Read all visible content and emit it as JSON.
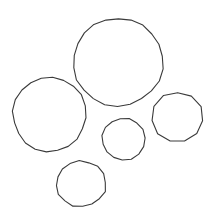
{
  "image": {
    "title": "circle-count-image",
    "width": 207,
    "height": 216,
    "background_color": "#ffffff",
    "stroke_color": "#3a3a3a",
    "stroke_width": 1.1,
    "fill": "none",
    "shape_type": "circle",
    "shape_count": 5,
    "render_style": "hand-drawn-polygonal-outline"
  },
  "shapes": [
    {
      "name": "circle-large-top-center",
      "label": "Large circle",
      "cx": 118,
      "cy": 62,
      "rx": 45,
      "ry": 44,
      "diameter": 90,
      "sides": 22,
      "jitter": 0.9,
      "seed": 11,
      "size_rank": 1
    },
    {
      "name": "circle-left",
      "label": "Left circle",
      "cx": 49.5,
      "cy": 114.5,
      "rx": 36.5,
      "ry": 37.5,
      "diameter": 74,
      "sides": 20,
      "jitter": 0.9,
      "seed": 27,
      "size_rank": 2
    },
    {
      "name": "circle-right",
      "label": "Right circle",
      "cx": 177.5,
      "cy": 117,
      "rx": 25.5,
      "ry": 25,
      "diameter": 50,
      "sides": 11,
      "jitter": 0.7,
      "seed": 43,
      "size_rank": 3
    },
    {
      "name": "circle-bottom",
      "label": "Bottom circle",
      "cx": 81,
      "cy": 184,
      "rx": 25,
      "ry": 23,
      "diameter": 48,
      "sides": 16,
      "jitter": 0.8,
      "seed": 58,
      "size_rank": 4
    },
    {
      "name": "circle-small-middle",
      "label": "Small middle circle",
      "cx": 123.5,
      "cy": 139,
      "rx": 21.5,
      "ry": 21,
      "diameter": 42,
      "sides": 15,
      "jitter": 0.6,
      "seed": 72,
      "size_rank": 5
    }
  ]
}
